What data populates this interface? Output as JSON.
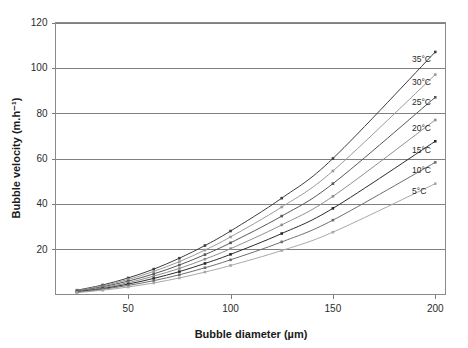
{
  "chart_data": {
    "type": "line",
    "title": "",
    "xlabel": "Bubble diameter (µm)",
    "ylabel": "Bubble velocity (m.h⁻¹)",
    "xlim": [
      14.5,
      205
    ],
    "ylim": [
      0,
      120
    ],
    "xticks": [
      50,
      100,
      150,
      200
    ],
    "yticks": [
      20,
      40,
      60,
      80,
      100,
      120
    ],
    "grid": true,
    "legend_position": "right-inline",
    "x": [
      25,
      37.5,
      50,
      62.5,
      75,
      87.5,
      100,
      125,
      150,
      200
    ],
    "series": [
      {
        "name": "35°C",
        "label": "35°C",
        "color": "#3d3d3d",
        "marker": "square",
        "values": [
          1.9,
          4.2,
          7.3,
          11.2,
          16.0,
          21.6,
          28.0,
          42.5,
          60.0,
          107.0
        ]
      },
      {
        "name": "30°C",
        "label": "30°C",
        "color": "#9a9a9a",
        "marker": "square",
        "values": [
          1.7,
          3.8,
          6.6,
          10.2,
          14.5,
          19.6,
          25.4,
          38.6,
          54.5,
          97.0
        ]
      },
      {
        "name": "25°C",
        "label": "25°C",
        "color": "#575757",
        "marker": "square",
        "values": [
          1.5,
          3.4,
          5.9,
          9.1,
          13.0,
          17.6,
          22.8,
          34.6,
          48.9,
          87.0
        ]
      },
      {
        "name": "20°C",
        "label": "20°C",
        "color": "#8f8f8f",
        "marker": "square",
        "values": [
          1.35,
          3.0,
          5.2,
          8.1,
          11.5,
          15.6,
          20.2,
          30.7,
          43.3,
          77.0
        ]
      },
      {
        "name": "15°C",
        "label": "15°C",
        "color": "#2b2b2b",
        "marker": "square",
        "values": [
          1.2,
          2.6,
          4.6,
          7.1,
          10.1,
          13.7,
          17.7,
          26.9,
          38.0,
          67.6
        ]
      },
      {
        "name": "10°C",
        "label": "10°C",
        "color": "#6e6e6e",
        "marker": "square",
        "values": [
          1.0,
          2.3,
          4.0,
          6.1,
          8.7,
          11.8,
          15.3,
          23.2,
          32.8,
          58.3
        ]
      },
      {
        "name": "5°C",
        "label": "5°C",
        "color": "#a8a8a8",
        "marker": "square",
        "values": [
          0.85,
          1.9,
          3.3,
          5.1,
          7.3,
          9.9,
          12.8,
          19.4,
          27.5,
          48.9
        ]
      }
    ],
    "legend_entries": [
      {
        "label": "35°C",
        "y_px": 62
      },
      {
        "label": "30°C",
        "y_px": 85
      },
      {
        "label": "25°C",
        "y_px": 105
      },
      {
        "label": "20°C",
        "y_px": 131
      },
      {
        "label": "15°C",
        "y_px": 153
      },
      {
        "label": "10°C",
        "y_px": 173
      },
      {
        "label": "5°C",
        "y_px": 194
      }
    ],
    "colors": {
      "grid": "#808080",
      "frame": "#8a8a8a",
      "text": "#1a1a1a",
      "background": "#ffffff"
    }
  }
}
